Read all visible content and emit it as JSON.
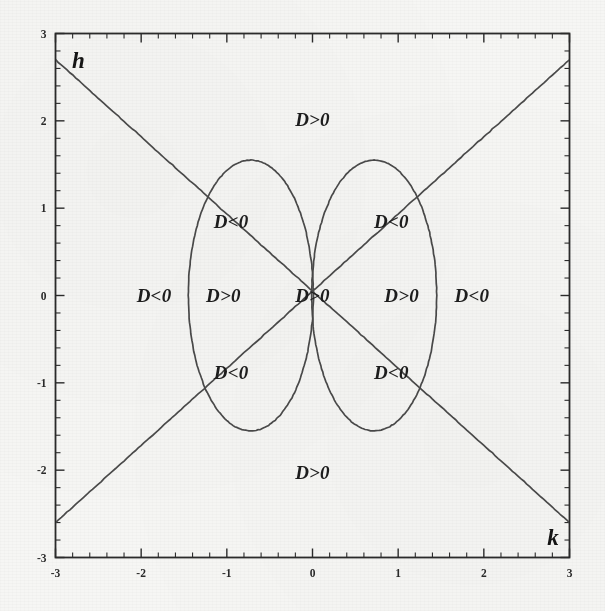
{
  "figure": {
    "background_color": "#f6f6f4",
    "ink_color": "#2b2b2b",
    "curve_color": "#4a4a4a"
  },
  "axes": {
    "x_label": "k",
    "y_label": "h",
    "x_ticks": [
      "-3",
      "-2",
      "-1",
      "0",
      "1",
      "2",
      "3"
    ],
    "y_ticks": [
      "3",
      "2",
      "1",
      "0",
      "-1",
      "-2",
      "-3"
    ]
  },
  "chart_data": {
    "type": "scatter",
    "xlabel": "k",
    "ylabel": "h",
    "xlim": [
      -3,
      3
    ],
    "ylim": [
      -3,
      3
    ],
    "xticks": [
      -3,
      -2,
      -1,
      0,
      1,
      2,
      3
    ],
    "yticks": [
      -3,
      -2,
      -1,
      0,
      1,
      2,
      3
    ],
    "minor_ticks_per_interval": 5,
    "grid": false,
    "legend": "none",
    "curves": [
      {
        "name": "left-ellipse",
        "kind": "ellipse",
        "center": [
          -0.72,
          0.0
        ],
        "semi_axis_x": 0.73,
        "semi_axis_y": 1.55
      },
      {
        "name": "right-ellipse",
        "kind": "ellipse",
        "center": [
          0.72,
          0.0
        ],
        "semi_axis_x": 0.73,
        "semi_axis_y": 1.55
      },
      {
        "name": "descending-line",
        "kind": "line",
        "slope": -0.93,
        "intercept": 0.87,
        "x_from": -3.0,
        "x_to": 3.0,
        "y_from": 2.7,
        "y_to": -2.6
      },
      {
        "name": "ascending-line",
        "kind": "line",
        "slope": 0.93,
        "intercept": 0.87,
        "x_from": -3.0,
        "x_to": 3.0,
        "y_from": -2.6,
        "y_to": 2.7
      }
    ],
    "annotations": [
      {
        "id": "top",
        "text": "D>0",
        "x": 0.0,
        "y": 2.02
      },
      {
        "id": "upper-left",
        "text": "D<0",
        "x": -0.95,
        "y": 0.85
      },
      {
        "id": "upper-right",
        "text": "D<0",
        "x": 0.92,
        "y": 0.85
      },
      {
        "id": "mid-far-left",
        "text": "D<0",
        "x": -1.85,
        "y": 0.0
      },
      {
        "id": "mid-left",
        "text": "D>0",
        "x": -1.04,
        "y": 0.0
      },
      {
        "id": "center",
        "text": "D>0",
        "x": 0.0,
        "y": 0.0
      },
      {
        "id": "mid-right",
        "text": "D>0",
        "x": 1.04,
        "y": 0.0
      },
      {
        "id": "mid-far-right",
        "text": "D<0",
        "x": 1.86,
        "y": 0.0
      },
      {
        "id": "lower-left",
        "text": "D<0",
        "x": -0.95,
        "y": -0.88
      },
      {
        "id": "lower-right",
        "text": "D<0",
        "x": 0.92,
        "y": -0.88
      },
      {
        "id": "bottom",
        "text": "D>0",
        "x": 0.0,
        "y": -2.03
      }
    ]
  }
}
